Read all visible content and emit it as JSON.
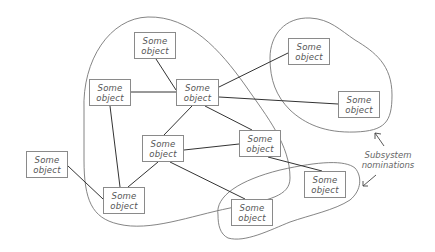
{
  "diagram": {
    "type": "object-network-with-subsystem-groupings",
    "objects": [
      {
        "id": "o1",
        "line1": "Some",
        "line2": "object",
        "x": 134,
        "y": 32,
        "w": 42,
        "h": 27
      },
      {
        "id": "o2",
        "line1": "Some",
        "line2": "object",
        "x": 89,
        "y": 79,
        "w": 42,
        "h": 27
      },
      {
        "id": "o3",
        "line1": "Some",
        "line2": "object",
        "x": 176,
        "y": 79,
        "w": 43,
        "h": 27
      },
      {
        "id": "o4",
        "line1": "Some",
        "line2": "object",
        "x": 288,
        "y": 38,
        "w": 42,
        "h": 27
      },
      {
        "id": "o5",
        "line1": "Some",
        "line2": "object",
        "x": 338,
        "y": 91,
        "w": 42,
        "h": 27
      },
      {
        "id": "o6",
        "line1": "Some",
        "line2": "object",
        "x": 142,
        "y": 135,
        "w": 42,
        "h": 27
      },
      {
        "id": "o7",
        "line1": "Some",
        "line2": "object",
        "x": 239,
        "y": 130,
        "w": 42,
        "h": 27
      },
      {
        "id": "o8",
        "line1": "Some",
        "line2": "object",
        "x": 26,
        "y": 151,
        "w": 42,
        "h": 27
      },
      {
        "id": "o9",
        "line1": "Some",
        "line2": "object",
        "x": 103,
        "y": 187,
        "w": 42,
        "h": 27
      },
      {
        "id": "o10",
        "line1": "Some",
        "line2": "object",
        "x": 231,
        "y": 199,
        "w": 42,
        "h": 27
      },
      {
        "id": "o11",
        "line1": "Some",
        "line2": "object",
        "x": 304,
        "y": 171,
        "w": 42,
        "h": 27
      }
    ],
    "connections": [
      [
        "o1",
        "o3"
      ],
      [
        "o2",
        "o3"
      ],
      [
        "o2",
        "o9"
      ],
      [
        "o3",
        "o4"
      ],
      [
        "o3",
        "o5"
      ],
      [
        "o3",
        "o6"
      ],
      [
        "o3",
        "o7"
      ],
      [
        "o6",
        "o7"
      ],
      [
        "o6",
        "o9"
      ],
      [
        "o6",
        "o10"
      ],
      [
        "o7",
        "o11"
      ],
      [
        "o8",
        "o9"
      ]
    ],
    "subsystems": [
      {
        "id": "s1",
        "members": [
          "o1",
          "o2",
          "o3",
          "o6",
          "o7",
          "o9"
        ]
      },
      {
        "id": "s2",
        "members": [
          "o4",
          "o5"
        ]
      },
      {
        "id": "s3",
        "members": [
          "o10",
          "o11"
        ]
      }
    ],
    "annotation": {
      "line1": "Subsystem",
      "line2": "nominations"
    },
    "colors": {
      "connector": "#333333",
      "subsystem_outline": "#777777",
      "box_border": "#8a8a8a",
      "text": "#555555"
    }
  }
}
